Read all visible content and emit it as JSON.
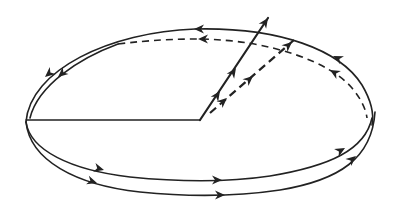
{
  "diagram": {
    "title": "Precessing orbit with rotating vector",
    "elements": {
      "orbit_upper_solid": {
        "style": "solid",
        "direction": "counter-clockwise (right to left along top)"
      },
      "orbit_upper_dashed": {
        "style": "dashed",
        "direction": "right to left along top"
      },
      "orbit_lower_inner": {
        "style": "solid",
        "direction": "left to right along bottom"
      },
      "orbit_lower_outer": {
        "style": "solid",
        "direction": "left to right along bottom"
      },
      "reference_radius": {
        "style": "solid",
        "orientation": "horizontal"
      },
      "vector_solid": {
        "style": "solid",
        "arrowheads": 3
      },
      "vector_dashed": {
        "style": "dashed",
        "arrowheads": 3
      }
    },
    "colors": {
      "ink": "#222222",
      "background": "#ffffff"
    }
  }
}
